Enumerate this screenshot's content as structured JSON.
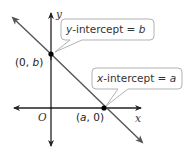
{
  "diagram": {
    "type": "coordinate-plane-intercepts",
    "axes": {
      "x_label": "x",
      "y_label": "y",
      "origin_label": "O"
    },
    "points": [
      {
        "label": "(0, b)",
        "label_var": "b",
        "role": "y-intercept"
      },
      {
        "label": "(a, 0)",
        "label_var": "a",
        "role": "x-intercept"
      }
    ],
    "callouts": [
      {
        "var_prefix": "y",
        "text": "-intercept = ",
        "value": "b",
        "full": "y-intercept = b"
      },
      {
        "var_prefix": "x",
        "text": "-intercept = ",
        "value": "a",
        "full": "x-intercept = a"
      }
    ],
    "colors": {
      "line": "#555555",
      "axis": "#222222",
      "point": "#000000",
      "callout_border": "#aaaaaa"
    }
  }
}
